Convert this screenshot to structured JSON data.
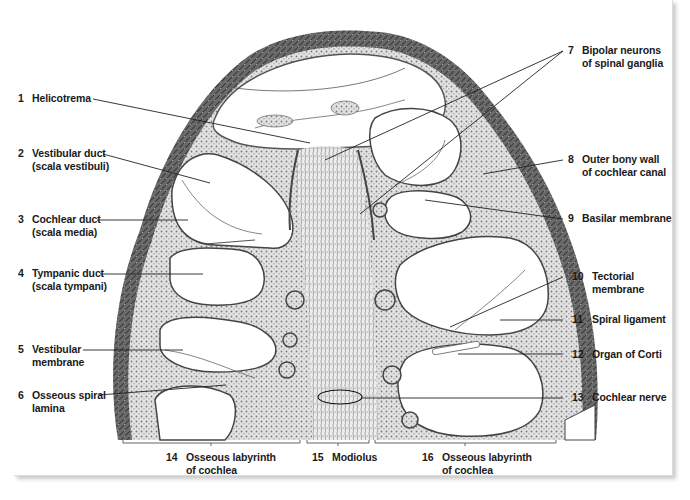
{
  "figure": {
    "labels": [
      {
        "num": "1",
        "line1": "Helicotrema",
        "line2": ""
      },
      {
        "num": "2",
        "line1": "Vestibular duct",
        "line2": "(scala vestibuli)"
      },
      {
        "num": "3",
        "line1": "Cochlear duct",
        "line2": "(scala media)"
      },
      {
        "num": "4",
        "line1": "Tympanic duct",
        "line2": "(scala tympani)"
      },
      {
        "num": "5",
        "line1": "Vestibular",
        "line2": "membrane"
      },
      {
        "num": "6",
        "line1": "Osseous spiral",
        "line2": "lamina"
      },
      {
        "num": "7",
        "line1": "Bipolar neurons",
        "line2": "of spinal ganglia"
      },
      {
        "num": "8",
        "line1": "Outer bony wall",
        "line2": "of cochlear canal"
      },
      {
        "num": "9",
        "line1": "Basilar membrane",
        "line2": ""
      },
      {
        "num": "10",
        "line1": "Tectorial",
        "line2": "membrane"
      },
      {
        "num": "11",
        "line1": "Spiral ligament",
        "line2": ""
      },
      {
        "num": "12",
        "line1": "Organ of Corti",
        "line2": ""
      },
      {
        "num": "13",
        "line1": "Cochlear nerve",
        "line2": ""
      },
      {
        "num": "14",
        "line1": "Osseous labyrinth",
        "line2": "of cochlea"
      },
      {
        "num": "15",
        "line1": "Modiolus",
        "line2": ""
      },
      {
        "num": "16",
        "line1": "Osseous labyrinth",
        "line2": "of cochlea"
      }
    ],
    "caption_partial": "",
    "colors": {
      "tissue_dark": "#5a5a5a",
      "tissue_light": "#d8d8d8",
      "leader_line": "#222222",
      "label_text": "#1a1a1a"
    }
  }
}
